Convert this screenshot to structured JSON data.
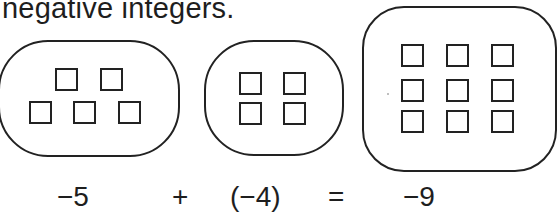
{
  "heading": "negative integers.",
  "sets": [
    {
      "name": "negative-five",
      "count": 5,
      "label": "−5"
    },
    {
      "name": "negative-four",
      "count": 4,
      "label": "(−4)"
    },
    {
      "name": "negative-nine",
      "count": 9,
      "label": "−9"
    }
  ],
  "equation": {
    "left": "−5",
    "operator": "+",
    "right": "(−4)",
    "equals": "=",
    "result": "−9"
  }
}
